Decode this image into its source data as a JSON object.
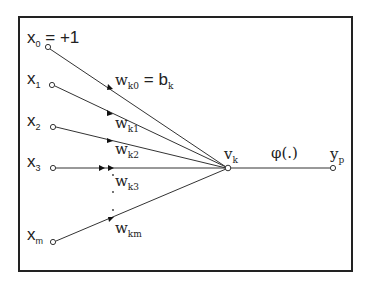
{
  "diagram": {
    "type": "single-neuron perceptron model",
    "inputs": [
      {
        "name": "x",
        "sub": "0",
        "suffix": "= +1"
      },
      {
        "name": "x",
        "sub": "1",
        "suffix": ""
      },
      {
        "name": "x",
        "sub": "2",
        "suffix": ""
      },
      {
        "name": "x",
        "sub": "3",
        "suffix": ""
      },
      {
        "name": "x",
        "sub": "m",
        "suffix": ""
      }
    ],
    "weights": [
      {
        "name": "w",
        "sub": "k0",
        "suffix": "= b",
        "suffix_sub": "k"
      },
      {
        "name": "w",
        "sub": "k1"
      },
      {
        "name": "w",
        "sub": "k2"
      },
      {
        "name": "w",
        "sub": "k3"
      },
      {
        "name": "w",
        "sub": "km"
      }
    ],
    "summing_node": {
      "name": "v",
      "sub": "k"
    },
    "activation": {
      "label": "φ(.)"
    },
    "output": {
      "name": "y",
      "sub": "p"
    },
    "colors": {
      "line": "#333333",
      "border": "#222222",
      "background": "#ffffff"
    }
  }
}
